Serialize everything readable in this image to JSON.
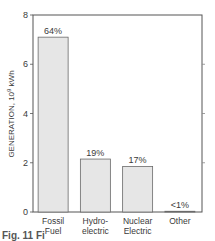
{
  "chart_data": {
    "type": "bar",
    "title": "",
    "xlabel": "",
    "ylabel": "GENERATION, 10^9 kWh",
    "ylabel_parts": {
      "main": "GENERATION, 10",
      "sup": "9",
      "unit": " kWh"
    },
    "ylim": [
      0,
      8
    ],
    "yticks": [
      0,
      2,
      4,
      6,
      8
    ],
    "grid": false,
    "legend": null,
    "categories": [
      "Fossil Fuel",
      "Hydro-electric",
      "Nuclear Electric",
      "Other"
    ],
    "category_lines": [
      [
        "Fossil",
        "Fuel"
      ],
      [
        "Hydro-",
        "electric"
      ],
      [
        "Nuclear",
        "Electric"
      ],
      [
        "Other"
      ]
    ],
    "values": [
      7.1,
      2.15,
      1.85,
      0.03
    ],
    "annotations": [
      "64%",
      "19%",
      "17%",
      "<1%"
    ]
  },
  "caption_fragment": "Fig. 11 Fi"
}
